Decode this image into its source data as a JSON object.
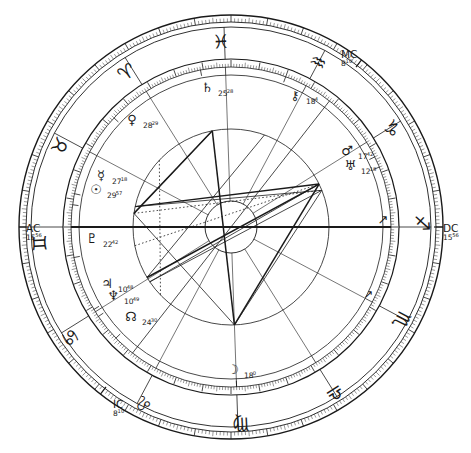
{
  "document": {
    "type": "astrological-natal-chart",
    "title": "Natal Horoscope Wheel",
    "background_color": "#ffffff",
    "ink_color": "#1a1a1a"
  },
  "chart_data": {
    "type": "scatter",
    "xlabel": "",
    "ylabel": "",
    "wheel": {
      "center_x": 231,
      "center_y": 227,
      "radius_outer_rim": 212,
      "radius_zodiac_outer": 200,
      "radius_zodiac_inner": 168,
      "radius_house_ring": 152,
      "radius_inner_aspect": 98,
      "radius_hub": 26,
      "ascendant_degree_on_screen": 180,
      "grid": false,
      "legend_position": "none"
    },
    "zodiac_signs": [
      {
        "name": "Aries",
        "glyph": "♈",
        "angle_deg": 123,
        "label": "Aries"
      },
      {
        "name": "Pisces",
        "glyph": "♓",
        "angle_deg": 93,
        "label": "Pisces"
      },
      {
        "name": "Aquarius",
        "glyph": "♒",
        "angle_deg": 63,
        "label": "Aquarius"
      },
      {
        "name": "Capricorn",
        "glyph": "♑",
        "angle_deg": 33,
        "label": "Capricorn"
      },
      {
        "name": "Sagittarius",
        "glyph": "♐",
        "angle_deg": 3,
        "label": "Sagittarius"
      },
      {
        "name": "Scorpio",
        "glyph": "♏",
        "angle_deg": 333,
        "label": "Scorpio"
      },
      {
        "name": "Libra",
        "glyph": "♎",
        "angle_deg": 303,
        "label": "Libra"
      },
      {
        "name": "Virgo",
        "glyph": "♍",
        "angle_deg": 273,
        "label": "Virgo"
      },
      {
        "name": "Leo",
        "glyph": "♌",
        "angle_deg": 243,
        "label": "Leo"
      },
      {
        "name": "Cancer",
        "glyph": "♋",
        "angle_deg": 213,
        "label": "Cancer"
      },
      {
        "name": "Gemini",
        "glyph": "♊",
        "angle_deg": 183,
        "label": "Gemini"
      },
      {
        "name": "Taurus",
        "glyph": "♉",
        "angle_deg": 153,
        "label": "Taurus"
      }
    ],
    "angles": [
      {
        "name": "Ascendant",
        "abbr": "AC",
        "degree": "15",
        "minute": "56",
        "angle_deg": 180,
        "side": "left"
      },
      {
        "name": "Descendant",
        "abbr": "DC",
        "degree": "15",
        "minute": "56",
        "angle_deg": 0,
        "side": "right"
      },
      {
        "name": "Midheaven",
        "abbr": "MC",
        "degree": "8",
        "minute": "10",
        "angle_deg": 52,
        "side": "upper-right"
      },
      {
        "name": "Imum Coeli",
        "abbr": "IC",
        "degree": "8",
        "minute": "10",
        "angle_deg": 232,
        "side": "lower-left"
      }
    ],
    "planets": [
      {
        "name": "Saturn",
        "glyph": "♄",
        "degree": "25",
        "minute": "28",
        "angle_deg": 101,
        "x": 207,
        "y": 92,
        "label": "Saturn 25°28"
      },
      {
        "name": "Chiron",
        "glyph": "⚷",
        "degree": "18",
        "minute": "4",
        "angle_deg": 70,
        "x": 295,
        "y": 100,
        "label": "Chiron 18°04"
      },
      {
        "name": "Venus",
        "glyph": "♀",
        "degree": "28",
        "minute": "29",
        "angle_deg": 137,
        "x": 132,
        "y": 124,
        "label": "Venus 28°29"
      },
      {
        "name": "Mercury",
        "glyph": "☿",
        "degree": "27",
        "minute": "18",
        "angle_deg": 168,
        "x": 101,
        "y": 180,
        "label": "Mercury 27°18"
      },
      {
        "name": "Sun",
        "glyph": "☉",
        "degree": "29",
        "minute": "57",
        "angle_deg": 172,
        "x": 96,
        "y": 194,
        "label": "Sun 29°57"
      },
      {
        "name": "Mars",
        "glyph": "♂",
        "degree": "17",
        "minute": "42",
        "angle_deg": 26,
        "x": 347,
        "y": 155,
        "label": "Mars 17°42"
      },
      {
        "name": "Uranus",
        "glyph": "♅",
        "degree": "12",
        "minute": "18",
        "angle_deg": 22,
        "x": 350,
        "y": 170,
        "label": "Uranus 12°18"
      },
      {
        "name": "Pluto",
        "glyph": "♇",
        "degree": "22",
        "minute": "42",
        "angle_deg": 191,
        "x": 92,
        "y": 243,
        "label": "Pluto 22°42"
      },
      {
        "name": "Jupiter",
        "glyph": "♃",
        "degree": "10",
        "minute": "48",
        "angle_deg": 211,
        "x": 107,
        "y": 288,
        "label": "Jupiter 10°48"
      },
      {
        "name": "Neptune",
        "glyph": "♆",
        "degree": "10",
        "minute": "49",
        "angle_deg": 214,
        "x": 113,
        "y": 300,
        "label": "Neptune 10°49"
      },
      {
        "name": "North Node",
        "glyph": "☊",
        "degree": "24",
        "minute": "30",
        "angle_deg": 224,
        "x": 131,
        "y": 321,
        "label": "North Node 24°30"
      },
      {
        "name": "Moon",
        "glyph": "☽",
        "degree": "18",
        "minute": "0",
        "angle_deg": 272,
        "x": 233,
        "y": 374,
        "label": "Moon 18°00"
      }
    ],
    "house_cusps_deg": [
      180,
      152,
      122,
      92,
      62,
      32,
      0,
      332,
      302,
      272,
      242,
      212
    ],
    "aspect_lines": [
      {
        "from": "Sun/Mercury",
        "to": "Saturn",
        "style": "solid"
      },
      {
        "from": "Sun/Mercury",
        "to": "Mars",
        "style": "solid"
      },
      {
        "from": "Sun/Mercury",
        "to": "Uranus",
        "style": "dotted"
      },
      {
        "from": "Saturn",
        "to": "Moon",
        "style": "solid"
      },
      {
        "from": "Mars",
        "to": "Moon",
        "style": "solid"
      },
      {
        "from": "Uranus",
        "to": "Moon",
        "style": "solid"
      },
      {
        "from": "Mars",
        "to": "Jupiter",
        "style": "solid"
      },
      {
        "from": "Uranus",
        "to": "Neptune",
        "style": "solid"
      },
      {
        "from": "Venus",
        "to": "Node",
        "style": "dotted"
      },
      {
        "from": "Pluto",
        "to": "Venus",
        "style": "dotted"
      }
    ]
  }
}
